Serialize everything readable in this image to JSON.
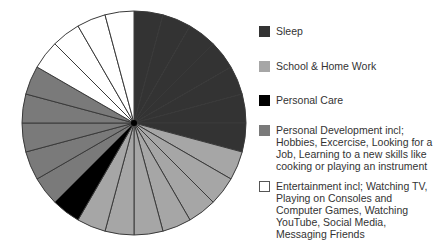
{
  "chart_data": {
    "type": "pie",
    "title": "",
    "unit": "hours per day",
    "total": 24,
    "slice_count": 24,
    "start_angle_deg": -90,
    "direction": "clockwise",
    "categories": [
      "Sleep",
      "School & Home Work",
      "Personal Care",
      "Personal Development incl; Hobbies, Excercise, Looking for a Job, Learning to a new skills like cooking or playing an instrument",
      "Entertainment incl; Watching TV, Playing on Consoles and Computer Games, Watching YouTube, Social Media, Messaging Friends"
    ],
    "values": [
      7,
      7,
      1,
      5,
      4
    ],
    "colors": [
      "#333333",
      "#a6a6a6",
      "#000000",
      "#7a7a7a",
      "#ffffff"
    ],
    "legend_position": "right"
  },
  "legend": [
    {
      "label": "Sleep",
      "color": "#333333"
    },
    {
      "label": "School & Home Work",
      "color": "#a6a6a6"
    },
    {
      "label": "Personal Care",
      "color": "#000000"
    },
    {
      "label": "Personal Development incl; Hobbies, Excercise, Looking for a Job, Learning to a new skills like cooking or playing an instrument",
      "color": "#7a7a7a"
    },
    {
      "label": "Entertainment incl; Watching TV, Playing on Consoles and Computer Games, Watching YouTube, Social Media, Messaging Friends",
      "color": "#ffffff"
    }
  ]
}
